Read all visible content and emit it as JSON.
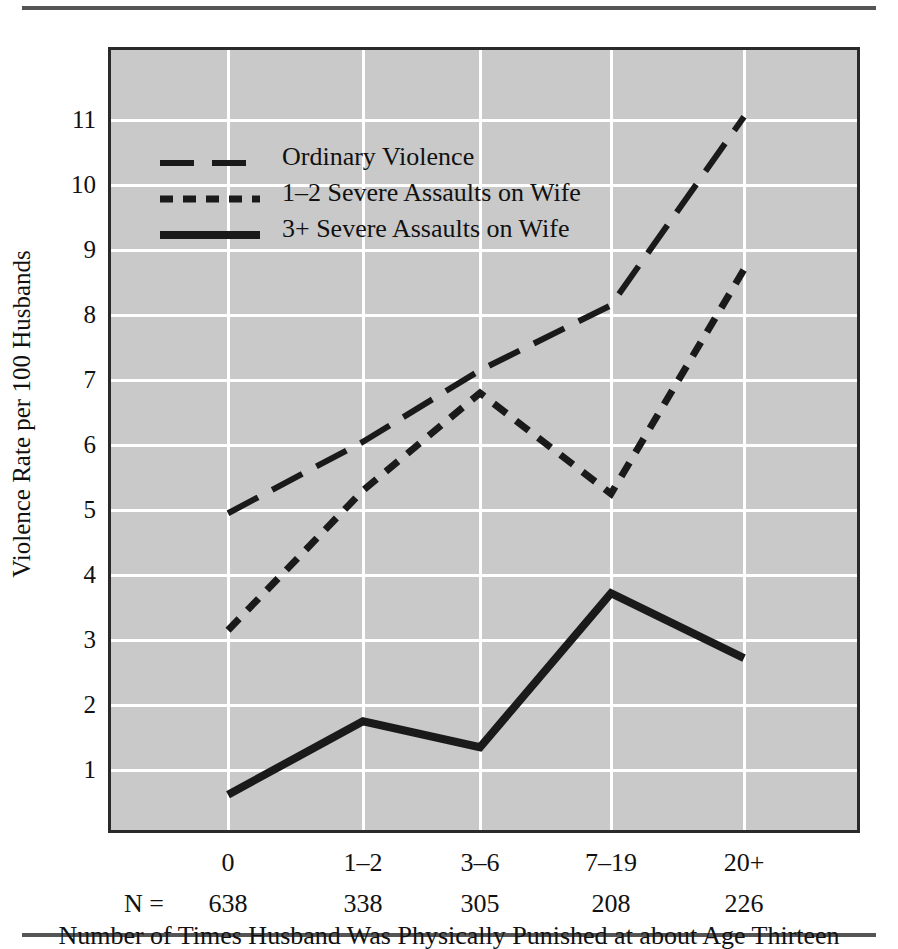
{
  "chart_data": {
    "type": "line",
    "title": "",
    "xlabel": "Number of Times Husband Was Physically Punished at about Age Thirteen",
    "ylabel": "Violence Rate per 100 Husbands",
    "categories": [
      "0",
      "1–2",
      "3–6",
      "7–19",
      "20+"
    ],
    "n_prefix": "N =",
    "n_values": [
      "638",
      "338",
      "305",
      "208",
      "226"
    ],
    "ylim": [
      0,
      11.6
    ],
    "yticks": [
      1,
      2,
      3,
      4,
      5,
      6,
      7,
      8,
      9,
      10,
      11
    ],
    "ytick_labels": [
      "1",
      "2",
      "3",
      "4",
      "5",
      "6",
      "7",
      "8",
      "9",
      "10",
      "11"
    ],
    "grid": true,
    "legend_position": "upper-left",
    "plot_background": "#c9c9c9",
    "line_color": "#1a1a1a",
    "series": [
      {
        "name": "Ordinary Violence",
        "style": "long-dash",
        "values": [
          4.95,
          6.05,
          7.15,
          8.15,
          11.05
        ]
      },
      {
        "name": "1–2 Severe Assaults on Wife",
        "style": "short-dash",
        "values": [
          3.15,
          5.3,
          6.8,
          5.25,
          8.7
        ]
      },
      {
        "name": "3+ Severe Assaults on Wife",
        "style": "solid",
        "values": [
          0.62,
          1.75,
          1.35,
          3.72,
          2.72
        ]
      }
    ]
  }
}
